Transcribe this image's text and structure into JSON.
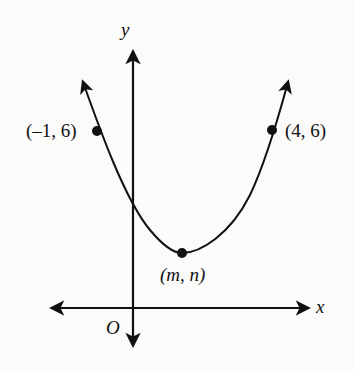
{
  "diagram": {
    "type": "coordinate-plane-parabola",
    "axes": {
      "x_label": "x",
      "y_label": "y",
      "origin_label": "O"
    },
    "points": [
      {
        "id": "left-point",
        "label": "(–1, 6)",
        "x": -1,
        "y": 6
      },
      {
        "id": "right-point",
        "label": "(4, 6)",
        "x": 4,
        "y": 6
      },
      {
        "id": "vertex",
        "label": "(m, n)",
        "x": "m",
        "y": "n"
      }
    ],
    "curve": {
      "kind": "parabola",
      "opens": "up",
      "symmetric_points": [
        "(–1, 6)",
        "(4, 6)"
      ],
      "vertex": "(m, n)"
    },
    "colors": {
      "ink": "#111111",
      "background": "#fbfbfa"
    }
  }
}
